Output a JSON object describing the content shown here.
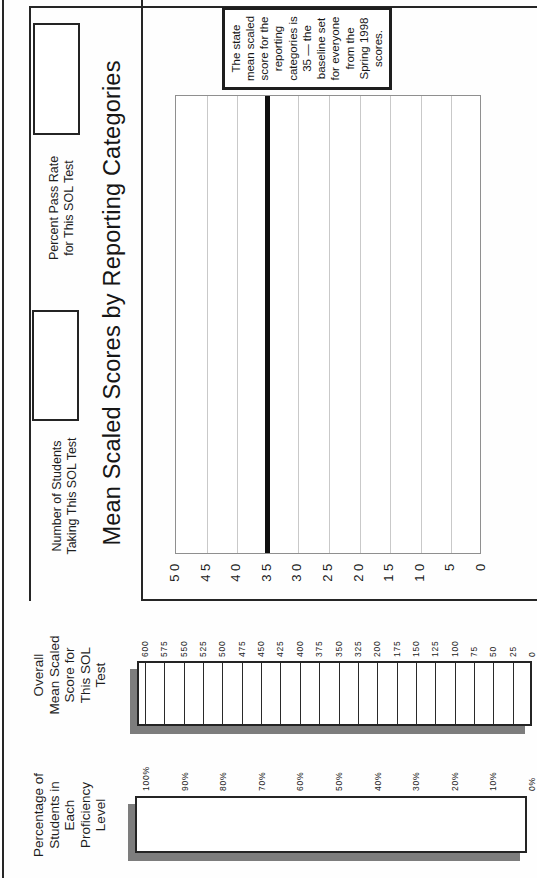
{
  "document": {
    "title": "Mean Scaled Scores by Reporting Categories",
    "headers": {
      "proficiency": [
        "Percentage of",
        "Students in",
        "Each",
        "Proficiency",
        "Level"
      ],
      "overall": [
        "Overall",
        "Mean Scaled",
        "Score for",
        "This SOL",
        "Test"
      ]
    },
    "fields": {
      "students": {
        "label": [
          "Number of Students",
          "Taking This SOL Test"
        ],
        "value": ""
      },
      "pass_rate": {
        "label": [
          "Percent Pass Rate",
          "for This SOL Test"
        ],
        "value": ""
      }
    },
    "note": [
      "The state",
      "mean scaled",
      "score for the",
      "reporting",
      "categories is",
      "35 — the",
      "baseline set",
      "for everyone",
      "from the",
      "Spring 1998",
      "scores."
    ],
    "scales": {
      "percent_labels": [
        "100%",
        "90%",
        "80%",
        "70%",
        "60%",
        "50%",
        "40%",
        "30%",
        "20%",
        "10%",
        "0%"
      ],
      "score_labels": [
        "600",
        "575",
        "550",
        "525",
        "500",
        "475",
        "450",
        "425",
        "400",
        "375",
        "350",
        "325",
        "200",
        "175",
        "150",
        "125",
        "100",
        "75",
        "50",
        "25",
        "0"
      ]
    },
    "colors": {
      "ink": "#222222",
      "shadow": "#7d7d7d",
      "grid": "#c9c9c9",
      "plot_border": "#8f8f8f",
      "baseline": "#0f0f0f"
    }
  },
  "chart_data": {
    "type": "bar",
    "title": "Mean Scaled Scores by Reporting Categories",
    "categories": [],
    "series": [],
    "ylim": [
      0,
      50
    ],
    "yticks": [
      50,
      45,
      40,
      35,
      30,
      25,
      20,
      15,
      10,
      5,
      0
    ],
    "baseline_value": 35,
    "annotation": "The state mean scaled score for the reporting categories is 35 — the baseline set for everyone from the Spring 1998 scores.",
    "grid": "on",
    "legend": "none",
    "plot_is_empty_template": true
  }
}
